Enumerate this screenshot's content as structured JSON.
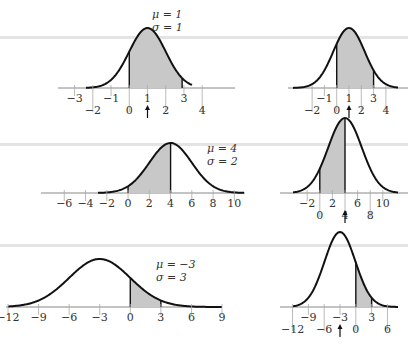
{
  "chart_data": [
    {
      "type": "line",
      "title": "Normal density N(mu, sigma) with shaded interval",
      "panel": "row1-left",
      "params": {
        "mu": 1,
        "sigma": 1
      },
      "param_labels": [
        "μ = 1",
        "σ = 1"
      ],
      "x_ticks_upper": [
        -3,
        -1,
        1,
        3
      ],
      "x_ticks_lower": [
        -2,
        0,
        2,
        4
      ],
      "xlim": [
        -3.8,
        5.8
      ],
      "shaded_interval": [
        0,
        2.9
      ],
      "mean_arrow_at": 1,
      "grid": false
    },
    {
      "type": "line",
      "title": "Same distribution on standardized-width axis",
      "panel": "row1-right",
      "params": {
        "mu": 1,
        "sigma": 1
      },
      "x_ticks_upper": [
        -1,
        1,
        3
      ],
      "x_ticks_lower": [
        -2,
        0,
        2,
        4
      ],
      "xlim": [
        -3.8,
        5.8
      ],
      "shaded_interval": [
        0,
        3
      ],
      "mean_arrow_at": 1,
      "grid": false
    },
    {
      "type": "line",
      "title": "Normal density N(mu, sigma) with shaded interval",
      "panel": "row2-left",
      "params": {
        "mu": 4,
        "sigma": 2
      },
      "param_labels": [
        "μ = 4",
        "σ = 2"
      ],
      "x_ticks": [
        -6,
        -4,
        -2,
        0,
        2,
        4,
        6,
        8,
        10
      ],
      "xlim": [
        -8,
        11
      ],
      "shaded_interval": [
        0,
        4
      ],
      "grid": false
    },
    {
      "type": "line",
      "title": "Same distribution on standardized-width axis",
      "panel": "row2-right",
      "params": {
        "mu": 4,
        "sigma": 2
      },
      "x_ticks_upper": [
        -2,
        2,
        6,
        10
      ],
      "x_ticks_lower": [
        0,
        4,
        8
      ],
      "xlim": [
        -6,
        14
      ],
      "shaded_interval": [
        0,
        4
      ],
      "mean_arrow_at": 4,
      "grid": false
    },
    {
      "type": "line",
      "title": "Normal density N(mu, sigma) with shaded interval",
      "panel": "row3-left",
      "params": {
        "mu": -3,
        "sigma": 3
      },
      "param_labels": [
        "μ = −3",
        "σ =   3"
      ],
      "x_ticks": [
        -12,
        -9,
        -6,
        -3,
        0,
        3,
        6,
        9
      ],
      "xlim": [
        -12,
        9
      ],
      "shaded_interval": [
        0,
        3
      ],
      "grid": false
    },
    {
      "type": "line",
      "title": "Same distribution on standardized-width axis",
      "panel": "row3-right",
      "params": {
        "mu": -3,
        "sigma": 3
      },
      "x_ticks_upper": [
        -9,
        -3,
        3
      ],
      "x_ticks_lower": [
        -12,
        -6,
        0,
        6
      ],
      "xlim": [
        -14,
        8
      ],
      "shaded_interval": [
        0,
        3
      ],
      "mean_arrow_at": -3,
      "grid": false
    }
  ],
  "labels": {
    "r1_mu": "μ = 1",
    "r1_sigma": "σ = 1",
    "r2_mu": "μ = 4",
    "r2_sigma": "σ = 2",
    "r3_mu": "μ = −3",
    "r3_sigma": "σ =   3"
  }
}
